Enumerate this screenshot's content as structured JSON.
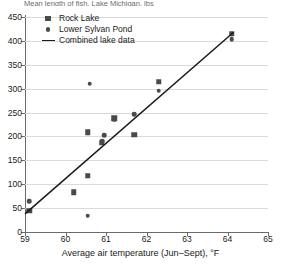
{
  "title_clipped": "Mean length of fish, Lake Michigan, lbs",
  "legend": {
    "items": [
      {
        "label": "Rock Lake",
        "marker": "square",
        "color": "#4a4a4a"
      },
      {
        "label": "Lower Sylvan Pond",
        "marker": "circle",
        "color": "#4a4a4a"
      },
      {
        "label": "Combined lake data",
        "marker": "line",
        "color": "#1a1a1a"
      }
    ]
  },
  "chart_data": {
    "type": "scatter",
    "title": "",
    "xlabel": "Average air temperature (Jun–Sept), °F",
    "ylabel": "",
    "xlim": [
      59,
      65
    ],
    "ylim": [
      0,
      450
    ],
    "xticks": [
      59,
      60,
      61,
      62,
      63,
      64,
      65
    ],
    "yticks": [
      0,
      50,
      100,
      150,
      200,
      250,
      300,
      350,
      400,
      450
    ],
    "grid": "horizontal",
    "legend_position": "top-left",
    "series": [
      {
        "name": "Rock Lake",
        "marker": "square",
        "color": "#4a4a4a",
        "points": [
          {
            "x": 59.1,
            "y": 45
          },
          {
            "x": 60.2,
            "y": 83
          },
          {
            "x": 60.55,
            "y": 118
          },
          {
            "x": 60.55,
            "y": 209
          },
          {
            "x": 60.9,
            "y": 187
          },
          {
            "x": 61.2,
            "y": 238
          },
          {
            "x": 61.7,
            "y": 204
          },
          {
            "x": 62.3,
            "y": 315
          },
          {
            "x": 64.1,
            "y": 415
          }
        ]
      },
      {
        "name": "Lower Sylvan Pond",
        "marker": "circle",
        "color": "#4a4a4a",
        "points": [
          {
            "x": 59.1,
            "y": 65
          },
          {
            "x": 60.55,
            "y": 34
          },
          {
            "x": 60.6,
            "y": 310
          },
          {
            "x": 60.9,
            "y": 190
          },
          {
            "x": 60.95,
            "y": 203
          },
          {
            "x": 61.2,
            "y": 236
          },
          {
            "x": 61.7,
            "y": 247
          },
          {
            "x": 62.3,
            "y": 296
          },
          {
            "x": 64.1,
            "y": 404
          }
        ]
      }
    ],
    "trendline": {
      "name": "Combined lake data",
      "color": "#1a1a1a",
      "x0": 59.0,
      "y0": 38,
      "x1": 64.15,
      "y1": 418
    }
  }
}
